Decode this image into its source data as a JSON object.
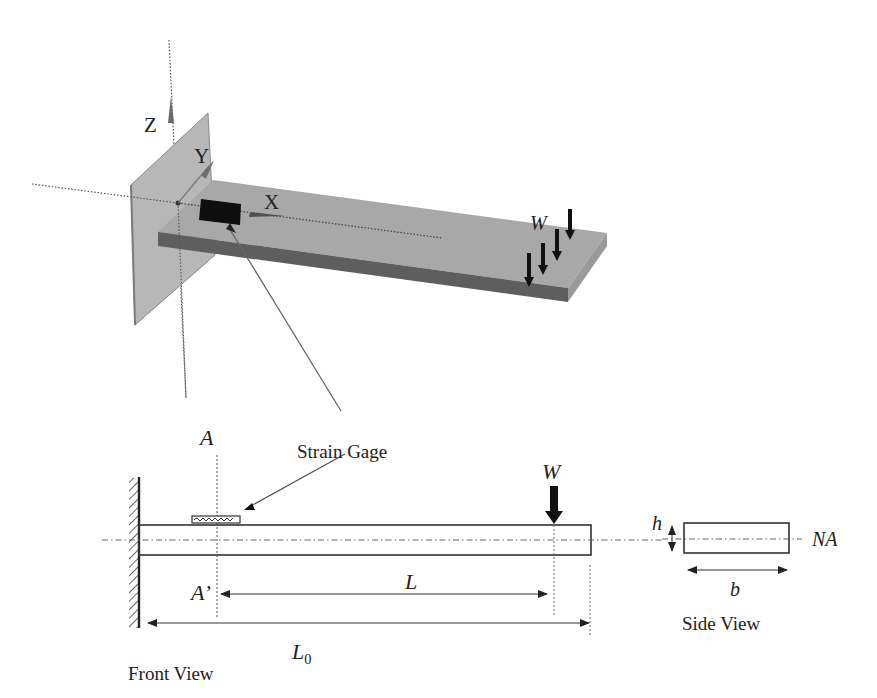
{
  "diagram": {
    "colors": {
      "background": "#ffffff",
      "wall_plate": "#b5b5b5",
      "wall_plate_edge": "#8a8a8a",
      "beam_top": "#a9a9a9",
      "beam_side": "#5e5e5e",
      "beam_end": "#9c9c9c",
      "gage_3d": "#0e0e0e",
      "axis_dotted": "#555555",
      "line": "#333333",
      "leader": "#666666",
      "load_arrow": "#111111"
    },
    "iso_view": {
      "axes": {
        "x_label": "X",
        "y_label": "Y",
        "z_label": "Z"
      },
      "load_label": "W",
      "load_arrow_count": 4
    },
    "front_view": {
      "caption": "Front View",
      "section_top_label": "A",
      "section_bottom_label": "A’",
      "strain_gage_label": "Strain Gage",
      "load_label": "W",
      "dim_L_label": "L",
      "dim_L0_label": "L",
      "dim_L0_subscript": "0"
    },
    "side_view": {
      "caption": "Side View",
      "height_label": "h",
      "width_label": "b",
      "neutral_axis_label": "NA"
    }
  }
}
